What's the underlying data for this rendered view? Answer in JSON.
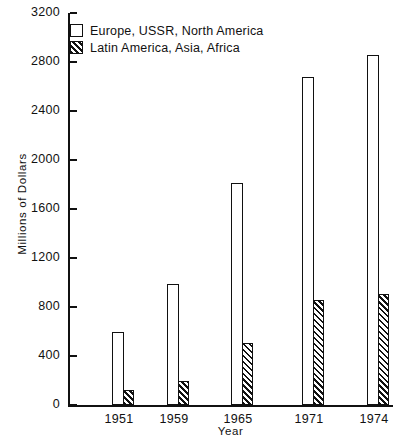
{
  "chart_data": {
    "type": "bar",
    "title": "",
    "xlabel": "Year",
    "ylabel": "Millions of Dollars",
    "categories": [
      "1951",
      "1959",
      "1965",
      "1971",
      "1974"
    ],
    "ylim": [
      0,
      3200
    ],
    "yticks": [
      0,
      400,
      800,
      1200,
      1600,
      2000,
      2400,
      2800,
      3200
    ],
    "ytick_labels": [
      "0",
      "400",
      "800",
      "1200",
      "1600",
      "2000",
      "2400",
      "2800",
      "3200"
    ],
    "grid": false,
    "legend_position": "top-left",
    "series": [
      {
        "name": "Europe, USSR, North America",
        "fill": "open",
        "values": [
          600,
          990,
          1810,
          2680,
          2860
        ]
      },
      {
        "name": "Latin America, Asia, Africa",
        "fill": "diagonal-hatch",
        "values": [
          120,
          200,
          510,
          860,
          910
        ]
      }
    ]
  },
  "legend": {
    "items": [
      {
        "label": "Europe, USSR, North America",
        "swatch": "open-square-swatch"
      },
      {
        "label": "Latin America, Asia, Africa",
        "swatch": "hatched-square-swatch"
      }
    ]
  },
  "colors": {
    "ink": "#111111",
    "background": "#ffffff"
  }
}
